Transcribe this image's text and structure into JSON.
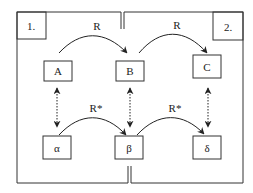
{
  "diagram": {
    "regions": [
      {
        "id": "region-1",
        "label": "1."
      },
      {
        "id": "region-2",
        "label": "2."
      }
    ],
    "nodes": {
      "A": {
        "label": "A"
      },
      "B": {
        "label": "B"
      },
      "C": {
        "label": "C"
      },
      "alpha": {
        "label": "α"
      },
      "beta": {
        "label": "β"
      },
      "delta": {
        "label": "δ"
      }
    },
    "edges": {
      "A_B": {
        "label": "R"
      },
      "B_C": {
        "label": "R"
      },
      "alpha_beta": {
        "label": "R*"
      },
      "beta_delta": {
        "label": "R*"
      }
    },
    "correspondences": [
      "A ↔ α",
      "B ↔ β",
      "C ↔ δ"
    ],
    "colors": {
      "stroke": "#333333",
      "background": "#ffffff"
    }
  }
}
